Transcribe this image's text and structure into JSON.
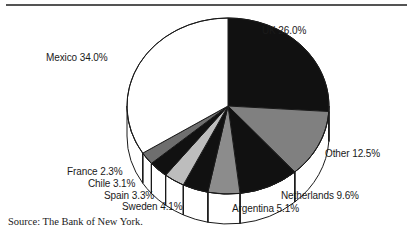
{
  "chart_data": {
    "type": "pie",
    "title": "",
    "subtitle": "",
    "xlabel": "",
    "ylabel": "",
    "legend_position": "none",
    "grid": false,
    "three_d": true,
    "start_angle_deg": 0,
    "direction": "clockwise",
    "units": "percent",
    "total": 100.0,
    "categories": [
      "UK",
      "Other",
      "Netherlands",
      "Argentina",
      "Sweden",
      "Spain",
      "Chile",
      "France",
      "Mexico"
    ],
    "values": [
      26.0,
      12.5,
      9.6,
      5.1,
      4.1,
      3.3,
      3.1,
      2.3,
      34.0
    ],
    "slices": [
      {
        "name": "UK",
        "value": 26.0,
        "label": "UK 26.0%",
        "fill": "#111111"
      },
      {
        "name": "Other",
        "value": 12.5,
        "label": "Other 12.5%",
        "fill": "#808080"
      },
      {
        "name": "Netherlands",
        "value": 9.6,
        "label": "Netherlands 9.6%",
        "fill": "#111111"
      },
      {
        "name": "Argentina",
        "value": 5.1,
        "label": "Argentina 5.1%",
        "fill": "#8c8c8c"
      },
      {
        "name": "Sweden",
        "value": 4.1,
        "label": "Sweden 4.1%",
        "fill": "#111111"
      },
      {
        "name": "Spain",
        "value": 3.3,
        "label": "Spain 3.3%",
        "fill": "#bdbdbd"
      },
      {
        "name": "Chile",
        "value": 3.1,
        "label": "Chile 3.1%",
        "fill": "#111111"
      },
      {
        "name": "France",
        "value": 2.3,
        "label": "France 2.3%",
        "fill": "#6e6e6e"
      },
      {
        "name": "Mexico",
        "value": 34.0,
        "label": "Mexico 34.0%",
        "fill": "#ffffff"
      }
    ],
    "colors": {
      "black": "#111111",
      "mid_gray": "#808080",
      "light_gray": "#bdbdbd",
      "dark_gray": "#6e6e6e",
      "white": "#ffffff",
      "outline": "#1a1a1a"
    },
    "annotations": {
      "source": "Source: The Bank of New York."
    }
  },
  "labels": {
    "uk": "UK 26.0%",
    "mexico": "Mexico 34.0%",
    "other": "Other 12.5%",
    "netherlands": "Netherlands 9.6%",
    "argentina": "Argentina 5.1%",
    "sweden": "Sweden 4.1%",
    "spain": "Spain 3.3%",
    "chile": "Chile 3.1%",
    "france": "France 2.3%"
  },
  "footer": {
    "source": "Source: The Bank of New York."
  }
}
